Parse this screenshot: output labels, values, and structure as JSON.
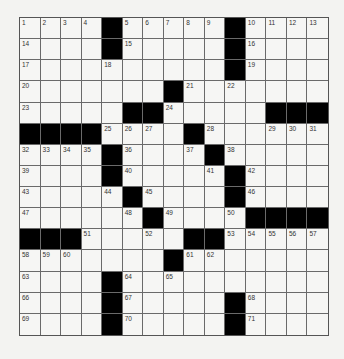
{
  "puzzle": {
    "rows": 15,
    "cols": 15,
    "grid": [
      "....#.....#....",
      "....#.....#....",
      "..........#....",
      ".......#.......",
      ".....##.....###",
      "####....#......",
      "....#....#.....",
      "....#.....#....",
      ".....#....#....",
      "......#....####",
      "###.....##.....",
      ".......#.......",
      "....#..........",
      "....#.....#....",
      "....#.....#...."
    ],
    "numbers": [
      {
        "r": 0,
        "c": 0,
        "n": "1"
      },
      {
        "r": 0,
        "c": 1,
        "n": "2"
      },
      {
        "r": 0,
        "c": 2,
        "n": "3"
      },
      {
        "r": 0,
        "c": 3,
        "n": "4"
      },
      {
        "r": 0,
        "c": 5,
        "n": "5"
      },
      {
        "r": 0,
        "c": 6,
        "n": "6"
      },
      {
        "r": 0,
        "c": 7,
        "n": "7"
      },
      {
        "r": 0,
        "c": 8,
        "n": "8"
      },
      {
        "r": 0,
        "c": 9,
        "n": "9"
      },
      {
        "r": 0,
        "c": 11,
        "n": "10"
      },
      {
        "r": 0,
        "c": 12,
        "n": "11"
      },
      {
        "r": 0,
        "c": 13,
        "n": "12"
      },
      {
        "r": 0,
        "c": 14,
        "n": "13"
      },
      {
        "r": 1,
        "c": 0,
        "n": "14"
      },
      {
        "r": 1,
        "c": 5,
        "n": "15"
      },
      {
        "r": 1,
        "c": 11,
        "n": "16"
      },
      {
        "r": 2,
        "c": 0,
        "n": "17"
      },
      {
        "r": 2,
        "c": 4,
        "n": "18"
      },
      {
        "r": 2,
        "c": 11,
        "n": "19"
      },
      {
        "r": 3,
        "c": 0,
        "n": "20"
      },
      {
        "r": 3,
        "c": 8,
        "n": "21"
      },
      {
        "r": 3,
        "c": 10,
        "n": "22"
      },
      {
        "r": 4,
        "c": 0,
        "n": "23"
      },
      {
        "r": 4,
        "c": 7,
        "n": "24"
      },
      {
        "r": 5,
        "c": 4,
        "n": "25"
      },
      {
        "r": 5,
        "c": 5,
        "n": "26"
      },
      {
        "r": 5,
        "c": 6,
        "n": "27"
      },
      {
        "r": 5,
        "c": 9,
        "n": "28"
      },
      {
        "r": 5,
        "c": 12,
        "n": "29"
      },
      {
        "r": 5,
        "c": 13,
        "n": "30"
      },
      {
        "r": 5,
        "c": 14,
        "n": "31"
      },
      {
        "r": 6,
        "c": 0,
        "n": "32"
      },
      {
        "r": 6,
        "c": 1,
        "n": "33"
      },
      {
        "r": 6,
        "c": 2,
        "n": "34"
      },
      {
        "r": 6,
        "c": 3,
        "n": "35"
      },
      {
        "r": 6,
        "c": 5,
        "n": "36"
      },
      {
        "r": 6,
        "c": 8,
        "n": "37"
      },
      {
        "r": 6,
        "c": 10,
        "n": "38"
      },
      {
        "r": 7,
        "c": 0,
        "n": "39"
      },
      {
        "r": 7,
        "c": 5,
        "n": "40"
      },
      {
        "r": 7,
        "c": 9,
        "n": "41"
      },
      {
        "r": 7,
        "c": 11,
        "n": "42"
      },
      {
        "r": 8,
        "c": 0,
        "n": "43"
      },
      {
        "r": 8,
        "c": 4,
        "n": "44"
      },
      {
        "r": 8,
        "c": 6,
        "n": "45"
      },
      {
        "r": 8,
        "c": 11,
        "n": "46"
      },
      {
        "r": 9,
        "c": 0,
        "n": "47"
      },
      {
        "r": 9,
        "c": 5,
        "n": "48"
      },
      {
        "r": 9,
        "c": 7,
        "n": "49"
      },
      {
        "r": 9,
        "c": 10,
        "n": "50"
      },
      {
        "r": 10,
        "c": 3,
        "n": "51"
      },
      {
        "r": 10,
        "c": 6,
        "n": "52"
      },
      {
        "r": 10,
        "c": 10,
        "n": "53"
      },
      {
        "r": 10,
        "c": 11,
        "n": "54"
      },
      {
        "r": 10,
        "c": 12,
        "n": "55"
      },
      {
        "r": 10,
        "c": 13,
        "n": "56"
      },
      {
        "r": 10,
        "c": 14,
        "n": "57"
      },
      {
        "r": 11,
        "c": 0,
        "n": "58"
      },
      {
        "r": 11,
        "c": 1,
        "n": "59"
      },
      {
        "r": 11,
        "c": 2,
        "n": "60"
      },
      {
        "r": 11,
        "c": 8,
        "n": "61"
      },
      {
        "r": 11,
        "c": 9,
        "n": "62"
      },
      {
        "r": 12,
        "c": 0,
        "n": "63"
      },
      {
        "r": 12,
        "c": 5,
        "n": "64"
      },
      {
        "r": 12,
        "c": 7,
        "n": "65"
      },
      {
        "r": 13,
        "c": 0,
        "n": "66"
      },
      {
        "r": 13,
        "c": 5,
        "n": "67"
      },
      {
        "r": 13,
        "c": 11,
        "n": "68"
      },
      {
        "r": 14,
        "c": 0,
        "n": "69"
      },
      {
        "r": 14,
        "c": 5,
        "n": "70"
      },
      {
        "r": 14,
        "c": 11,
        "n": "71"
      }
    ],
    "colors": {
      "black_square": "#000000",
      "white_square": "#f6f6f4",
      "grid_line": "#6a6a6a",
      "number_text": "#333333"
    }
  }
}
